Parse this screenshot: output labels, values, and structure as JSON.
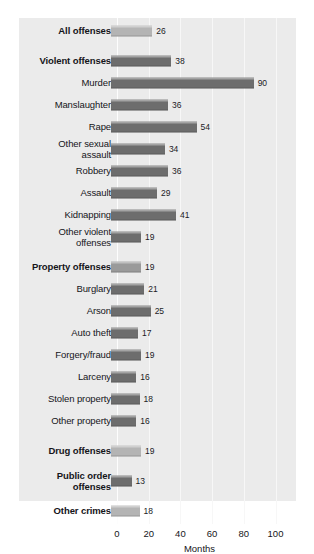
{
  "chart_data": {
    "type": "bar",
    "orientation": "horizontal",
    "title": "",
    "xlabel": "Months",
    "ylabel": "",
    "xlim": [
      0,
      100
    ],
    "xticks": [
      0,
      20,
      40,
      60,
      80,
      100
    ],
    "grid": true,
    "legend": "none",
    "categories": [
      "All offenses",
      "Violent offenses",
      "Murder",
      "Manslaughter",
      "Rape",
      "Other sexual\nassault",
      "Robbery",
      "Assault",
      "Kidnapping",
      "Other violent\noffenses",
      "Property offenses",
      "Burglary",
      "Arson",
      "Auto theft",
      "Forgery/fraud",
      "Larceny",
      "Stolen property",
      "Other property",
      "Drug offenses",
      "Public order\noffenses",
      "Other crimes"
    ],
    "values": [
      26,
      38,
      90,
      36,
      54,
      34,
      36,
      29,
      41,
      19,
      19,
      21,
      25,
      17,
      19,
      16,
      18,
      16,
      19,
      13,
      18
    ],
    "rows": [
      {
        "label": "All offenses",
        "value": 26,
        "bold": true,
        "shade": "light",
        "group_start": true
      },
      {
        "label": "Violent offenses",
        "value": 38,
        "bold": true,
        "shade": "dark",
        "group_start": true
      },
      {
        "label": "Murder",
        "value": 90,
        "bold": false,
        "shade": "dark",
        "group_start": false
      },
      {
        "label": "Manslaughter",
        "value": 36,
        "bold": false,
        "shade": "dark",
        "group_start": false
      },
      {
        "label": "Rape",
        "value": 54,
        "bold": false,
        "shade": "dark",
        "group_start": false
      },
      {
        "label": "Other sexual\nassault",
        "value": 34,
        "bold": false,
        "shade": "dark",
        "group_start": false
      },
      {
        "label": "Robbery",
        "value": 36,
        "bold": false,
        "shade": "dark",
        "group_start": false
      },
      {
        "label": "Assault",
        "value": 29,
        "bold": false,
        "shade": "dark",
        "group_start": false
      },
      {
        "label": "Kidnapping",
        "value": 41,
        "bold": false,
        "shade": "dark",
        "group_start": false
      },
      {
        "label": "Other violent\noffenses",
        "value": 19,
        "bold": false,
        "shade": "dark",
        "group_start": false
      },
      {
        "label": "Property offenses",
        "value": 19,
        "bold": true,
        "shade": "mid",
        "group_start": true
      },
      {
        "label": "Burglary",
        "value": 21,
        "bold": false,
        "shade": "dark",
        "group_start": false
      },
      {
        "label": "Arson",
        "value": 25,
        "bold": false,
        "shade": "dark",
        "group_start": false
      },
      {
        "label": "Auto theft",
        "value": 17,
        "bold": false,
        "shade": "dark",
        "group_start": false
      },
      {
        "label": "Forgery/fraud",
        "value": 19,
        "bold": false,
        "shade": "dark",
        "group_start": false
      },
      {
        "label": "Larceny",
        "value": 16,
        "bold": false,
        "shade": "dark",
        "group_start": false
      },
      {
        "label": "Stolen property",
        "value": 18,
        "bold": false,
        "shade": "dark",
        "group_start": false
      },
      {
        "label": "Other property",
        "value": 16,
        "bold": false,
        "shade": "dark",
        "group_start": false
      },
      {
        "label": "Drug offenses",
        "value": 19,
        "bold": true,
        "shade": "light",
        "group_start": true
      },
      {
        "label": "Public order\noffenses",
        "value": 13,
        "bold": true,
        "shade": "dark",
        "group_start": true
      },
      {
        "label": "Other crimes",
        "value": 18,
        "bold": true,
        "shade": "light",
        "group_start": true
      }
    ],
    "colors": {
      "panel_background": "#ebebeb",
      "bar_dark": "#6d6d6d",
      "bar_light": "#b4b4b4",
      "bar_mid": "#9a9a9a",
      "text": "#15151a",
      "gridline": "#f7f7f7"
    }
  }
}
